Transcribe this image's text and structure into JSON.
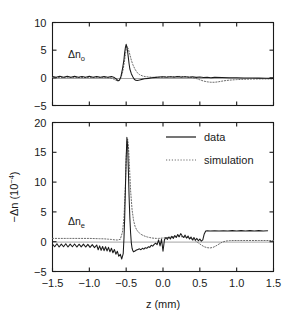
{
  "figure": {
    "xlabel": "z (mm)",
    "ylabel_main": "−Δn (10",
    "ylabel_exp": "−4",
    "ylabel_close": ")",
    "panel_top_label_main": "Δn",
    "panel_top_label_sub": "o",
    "panel_bottom_label_main": "Δn",
    "panel_bottom_label_sub": "e",
    "legend": [
      {
        "label": "data",
        "style": "solid",
        "color": "#1a1a1a"
      },
      {
        "label": "simulation",
        "style": "dotted",
        "color": "#6b6b6b"
      }
    ]
  },
  "chart_data": [
    {
      "type": "line",
      "panel": "top",
      "title": "",
      "xlabel": "",
      "ylabel": "Δn_o",
      "xlim": [
        -1.5,
        1.5
      ],
      "ylim": [
        -5,
        10
      ],
      "xticks": [
        -1.5,
        -1.0,
        -0.5,
        0.0,
        0.5,
        1.0,
        1.5
      ],
      "xticklabels": [
        "-1.5",
        "-1.0",
        "-0.5",
        "0.0",
        "0.5",
        "1.0",
        "1.5"
      ],
      "yticks": [
        -5,
        0,
        5,
        10
      ],
      "yticklabels": [
        "-5",
        "0",
        "5",
        "10"
      ],
      "grid": false,
      "legend_position": "none",
      "series": [
        {
          "name": "data",
          "style": "solid",
          "x": [
            -1.5,
            -1.45,
            -1.4,
            -1.35,
            -1.3,
            -1.25,
            -1.2,
            -1.15,
            -1.1,
            -1.05,
            -1.0,
            -0.95,
            -0.9,
            -0.85,
            -0.8,
            -0.75,
            -0.7,
            -0.66,
            -0.63,
            -0.61,
            -0.59,
            -0.57,
            -0.55,
            -0.53,
            -0.52,
            -0.51,
            -0.5,
            -0.49,
            -0.48,
            -0.47,
            -0.46,
            -0.45,
            -0.43,
            -0.41,
            -0.39,
            -0.37,
            -0.35,
            -0.32,
            -0.29,
            -0.25,
            -0.2,
            -0.15,
            -0.1,
            -0.05,
            0.0,
            0.05,
            0.1,
            0.15,
            0.2,
            0.25,
            0.3,
            0.35,
            0.4,
            0.45,
            0.5,
            0.55,
            0.6,
            0.65,
            0.7,
            0.8,
            0.9,
            1.0,
            1.1,
            1.2,
            1.3,
            1.4,
            1.5
          ],
          "y": [
            0.25,
            0.1,
            0.3,
            0.12,
            0.28,
            0.1,
            0.3,
            0.12,
            0.26,
            0.1,
            0.28,
            0.12,
            0.26,
            0.1,
            0.24,
            0.1,
            0.22,
            0.05,
            -0.25,
            -0.55,
            -0.4,
            0.3,
            1.6,
            3.3,
            4.6,
            5.5,
            6.05,
            5.6,
            4.7,
            3.6,
            2.5,
            1.6,
            0.75,
            0.2,
            -0.25,
            -0.45,
            -0.5,
            -0.4,
            -0.28,
            -0.18,
            -0.1,
            0.0,
            0.08,
            0.15,
            0.18,
            0.12,
            0.2,
            0.1,
            0.22,
            0.12,
            0.2,
            0.1,
            0.18,
            0.08,
            0.15,
            0.05,
            0.1,
            0.02,
            0.08,
            0.05,
            0.02,
            0.0,
            -0.02,
            -0.04,
            -0.05,
            -0.08,
            -0.1
          ]
        },
        {
          "name": "simulation",
          "style": "dotted",
          "x": [
            -1.5,
            -1.4,
            -1.3,
            -1.2,
            -1.1,
            -1.0,
            -0.9,
            -0.8,
            -0.72,
            -0.68,
            -0.64,
            -0.61,
            -0.58,
            -0.55,
            -0.53,
            -0.51,
            -0.5,
            -0.49,
            -0.47,
            -0.45,
            -0.43,
            -0.41,
            -0.38,
            -0.35,
            -0.32,
            -0.28,
            -0.24,
            -0.2,
            -0.15,
            -0.1,
            -0.05,
            0.0,
            0.05,
            0.1,
            0.15,
            0.2,
            0.25,
            0.3,
            0.35,
            0.4,
            0.45,
            0.5,
            0.55,
            0.6,
            0.65,
            0.7,
            0.75,
            0.8,
            0.85,
            0.9,
            1.0,
            1.1,
            1.2,
            1.3,
            1.4,
            1.5
          ],
          "y": [
            0.05,
            0.05,
            0.05,
            0.05,
            0.05,
            0.05,
            0.05,
            0.05,
            0.0,
            -0.15,
            -0.45,
            -0.55,
            -0.3,
            0.9,
            2.4,
            4.2,
            5.3,
            5.7,
            5.2,
            4.2,
            3.2,
            2.4,
            1.55,
            0.95,
            0.6,
            0.35,
            0.22,
            0.15,
            0.1,
            0.08,
            0.1,
            0.15,
            0.18,
            0.2,
            0.22,
            0.25,
            0.25,
            0.22,
            0.15,
            0.05,
            -0.12,
            -0.35,
            -0.58,
            -0.72,
            -0.8,
            -0.8,
            -0.72,
            -0.6,
            -0.5,
            -0.42,
            -0.32,
            -0.26,
            -0.22,
            -0.2,
            -0.2,
            -0.2
          ]
        }
      ]
    },
    {
      "type": "line",
      "panel": "bottom",
      "title": "",
      "xlabel": "z (mm)",
      "ylabel": "-Δn (10^-4)",
      "xlim": [
        -1.5,
        1.5
      ],
      "ylim": [
        -5,
        20
      ],
      "xticks": [
        -1.5,
        -1.0,
        -0.5,
        0.0,
        0.5,
        1.0,
        1.5
      ],
      "xticklabels": [
        "-1.5",
        "-1.0",
        "-0.5",
        "0.0",
        "0.5",
        "1.0",
        "1.5"
      ],
      "yticks": [
        -5,
        0,
        5,
        10,
        15,
        20
      ],
      "yticklabels": [
        "-5",
        "0",
        "5",
        "10",
        "15",
        "20"
      ],
      "grid": false,
      "legend_position": "upper right",
      "series": [
        {
          "name": "data",
          "style": "solid",
          "x": [
            -1.5,
            -1.47,
            -1.44,
            -1.41,
            -1.38,
            -1.35,
            -1.32,
            -1.29,
            -1.26,
            -1.23,
            -1.2,
            -1.17,
            -1.14,
            -1.11,
            -1.08,
            -1.05,
            -1.02,
            -0.99,
            -0.96,
            -0.93,
            -0.9,
            -0.88,
            -0.86,
            -0.84,
            -0.82,
            -0.8,
            -0.78,
            -0.76,
            -0.74,
            -0.72,
            -0.7,
            -0.68,
            -0.66,
            -0.64,
            -0.62,
            -0.6,
            -0.58,
            -0.56,
            -0.54,
            -0.53,
            -0.52,
            -0.51,
            -0.5,
            -0.49,
            -0.48,
            -0.47,
            -0.46,
            -0.45,
            -0.44,
            -0.43,
            -0.42,
            -0.41,
            -0.4,
            -0.38,
            -0.36,
            -0.34,
            -0.32,
            -0.3,
            -0.28,
            -0.26,
            -0.24,
            -0.22,
            -0.2,
            -0.18,
            -0.16,
            -0.14,
            -0.12,
            -0.1,
            -0.08,
            -0.06,
            -0.04,
            -0.02,
            0.0,
            0.02,
            0.04,
            0.06,
            0.08,
            0.1,
            0.12,
            0.14,
            0.16,
            0.18,
            0.2,
            0.22,
            0.24,
            0.26,
            0.28,
            0.3,
            0.32,
            0.34,
            0.36,
            0.38,
            0.4,
            0.42,
            0.44,
            0.46,
            0.48,
            0.5,
            0.52,
            0.54,
            0.56,
            0.58,
            0.6,
            0.64,
            0.7,
            0.76,
            0.82,
            0.88,
            0.94,
            1.0,
            1.06,
            1.12,
            1.18,
            1.24,
            1.3,
            1.36,
            1.42,
            1.5
          ],
          "y": [
            -0.4,
            -0.85,
            -0.35,
            -0.9,
            -0.4,
            -0.85,
            -0.35,
            -0.9,
            -0.4,
            -0.85,
            -0.38,
            -0.9,
            -0.42,
            -0.88,
            -0.4,
            -0.9,
            -0.45,
            -0.95,
            -0.5,
            -1.0,
            -0.55,
            -1.35,
            -0.7,
            -1.45,
            -0.8,
            -1.5,
            -0.85,
            -1.55,
            -0.95,
            -1.7,
            -1.1,
            -1.85,
            -1.3,
            -2.1,
            -1.6,
            -2.45,
            -2.1,
            -2.9,
            -2.0,
            0.5,
            4.0,
            9.0,
            14.0,
            17.5,
            16.0,
            12.0,
            7.5,
            4.0,
            1.5,
            -0.2,
            -1.1,
            -1.5,
            -1.7,
            -1.55,
            -1.4,
            -1.3,
            -1.2,
            -1.35,
            -1.1,
            -1.25,
            -1.0,
            -1.1,
            -0.85,
            -0.95,
            -0.6,
            -0.75,
            -0.45,
            -0.25,
            -0.5,
            0.3,
            -0.7,
            0.4,
            -1.6,
            0.35,
            0.7,
            0.4,
            0.8,
            0.45,
            0.9,
            0.55,
            1.05,
            0.7,
            1.2,
            0.85,
            1.35,
            1.0,
            0.7,
            1.1,
            0.6,
            0.95,
            0.45,
            0.8,
            0.3,
            0.7,
            0.25,
            0.55,
            0.15,
            0.45,
            0.1,
            0.3,
            1.3,
            1.8,
            1.85,
            1.8,
            1.85,
            1.78,
            1.85,
            1.78,
            1.86,
            1.78,
            1.86,
            1.78,
            1.86,
            1.78,
            1.86,
            1.78,
            1.82
          ]
        },
        {
          "name": "simulation",
          "style": "dotted",
          "x": [
            -1.5,
            -1.4,
            -1.3,
            -1.2,
            -1.1,
            -1.0,
            -0.92,
            -0.86,
            -0.8,
            -0.74,
            -0.7,
            -0.66,
            -0.62,
            -0.58,
            -0.55,
            -0.53,
            -0.51,
            -0.5,
            -0.49,
            -0.48,
            -0.47,
            -0.46,
            -0.45,
            -0.44,
            -0.42,
            -0.4,
            -0.38,
            -0.36,
            -0.34,
            -0.32,
            -0.3,
            -0.27,
            -0.24,
            -0.21,
            -0.18,
            -0.15,
            -0.12,
            -0.09,
            -0.06,
            -0.03,
            0.0,
            0.04,
            0.08,
            0.12,
            0.16,
            0.2,
            0.24,
            0.28,
            0.32,
            0.36,
            0.4,
            0.44,
            0.48,
            0.52,
            0.56,
            0.6,
            0.64,
            0.68,
            0.72,
            0.76,
            0.8,
            0.85,
            0.9,
            0.96,
            1.02,
            1.1,
            1.2,
            1.3,
            1.4,
            1.5
          ],
          "y": [
            0.55,
            0.55,
            0.55,
            0.55,
            0.55,
            0.55,
            0.52,
            0.5,
            0.48,
            0.42,
            0.38,
            0.32,
            0.28,
            0.4,
            1.6,
            4.0,
            9.5,
            14.0,
            16.6,
            17.2,
            16.2,
            14.0,
            11.2,
            8.6,
            5.4,
            3.6,
            2.6,
            2.05,
            1.7,
            1.45,
            1.25,
            1.05,
            0.9,
            0.78,
            0.7,
            0.62,
            0.58,
            0.55,
            0.55,
            0.58,
            0.62,
            0.68,
            0.72,
            0.78,
            0.82,
            0.85,
            0.85,
            0.82,
            0.75,
            0.62,
            0.42,
            0.15,
            -0.2,
            -0.55,
            -0.85,
            -1.0,
            -1.05,
            -0.95,
            -0.7,
            -0.4,
            -0.1,
            0.1,
            0.18,
            0.2,
            0.2,
            0.2,
            0.2,
            0.2,
            0.2,
            0.2
          ]
        }
      ]
    }
  ]
}
